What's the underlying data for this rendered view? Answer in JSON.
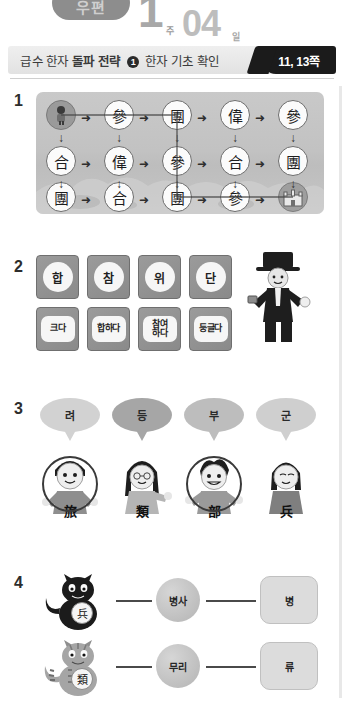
{
  "banner": {
    "pill_label": "우편",
    "week_number": "1",
    "week_unit": "주",
    "day_number": "04",
    "day_unit": "일"
  },
  "header": {
    "title_prefix": "급수 한자",
    "title_bold": "돌파 전략",
    "badge_circle": "1",
    "title_suffix": "한자 기초 확인",
    "page_label": "11, 13쪽"
  },
  "questions": [
    {
      "number": "1"
    },
    {
      "number": "2"
    },
    {
      "number": "3"
    },
    {
      "number": "4"
    }
  ],
  "q1_maze": {
    "rows": [
      [
        "START",
        "參",
        "團",
        "偉",
        "參"
      ],
      [
        "合",
        "偉",
        "參",
        "合",
        "團"
      ],
      [
        "團",
        "合",
        "團",
        "參",
        "GOAL"
      ]
    ],
    "start_icon": "child-icon",
    "goal_icon": "castle-icon",
    "right_arrow": "➜",
    "down_arrow": "↓"
  },
  "q2_cards": {
    "sound_row": [
      "합",
      "참",
      "위",
      "단"
    ],
    "meaning_row": [
      "크다",
      "합하다",
      "참여\n하다",
      "둥글다"
    ],
    "magician_icon": "magician-icon"
  },
  "q3": {
    "bubbles": [
      "려",
      "등",
      "부",
      "군"
    ],
    "kids": [
      {
        "icon": "boy-icon",
        "hanja": "旅",
        "circled": true
      },
      {
        "icon": "girl-icon",
        "hanja": "類",
        "circled": false
      },
      {
        "icon": "boy2-icon",
        "hanja": "部",
        "circled": true
      },
      {
        "icon": "girl2-icon",
        "hanja": "兵",
        "circled": false
      }
    ]
  },
  "q4": {
    "rows": [
      {
        "cat_icon": "black-cat-icon",
        "hanja": "兵",
        "meaning": "병사",
        "sound": "병"
      },
      {
        "cat_icon": "striped-cat-icon",
        "hanja": "類",
        "meaning": "무리",
        "sound": "류"
      }
    ]
  },
  "colors": {
    "badge_bg": "#1b1b1b",
    "header_bg": "#e8e8e8",
    "maze_bg": "#c4c4c4",
    "pen": "#3a3a3a"
  }
}
